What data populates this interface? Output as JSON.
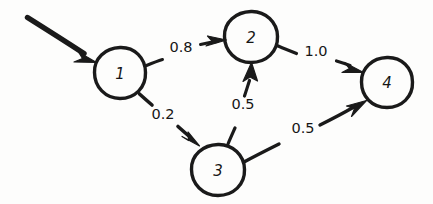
{
  "diagram": {
    "style": "hand-drawn",
    "ink_color": "#1a1a1a",
    "background_color": "#fdfdfc",
    "nodes": [
      {
        "id": "1",
        "label": "1",
        "cx": 120,
        "cy": 73,
        "r": 25
      },
      {
        "id": "2",
        "label": "2",
        "cx": 251,
        "cy": 37,
        "r": 26
      },
      {
        "id": "3",
        "label": "3",
        "cx": 218,
        "cy": 170,
        "r": 26
      },
      {
        "id": "4",
        "label": "4",
        "cx": 387,
        "cy": 82,
        "r": 25
      }
    ],
    "edges": [
      {
        "id": "e1-2",
        "from": "1",
        "to": "2",
        "weight": "0.8",
        "label_x": 181,
        "label_y": 47
      },
      {
        "id": "e1-3",
        "from": "1",
        "to": "3",
        "weight": "0.2",
        "label_x": 163,
        "label_y": 114
      },
      {
        "id": "e3-2",
        "from": "3",
        "to": "2",
        "weight": "0.5",
        "label_x": 243,
        "label_y": 104
      },
      {
        "id": "e2-4",
        "from": "2",
        "to": "4",
        "weight": "1.0",
        "label_x": 316,
        "label_y": 51
      },
      {
        "id": "e3-4",
        "from": "3",
        "to": "4",
        "weight": "0.5",
        "label_x": 303,
        "label_y": 128
      }
    ],
    "entry_arrow": {
      "id": "entry",
      "label": "",
      "from_x": 27,
      "from_y": 18,
      "to_x": 95,
      "to_y": 62
    }
  }
}
